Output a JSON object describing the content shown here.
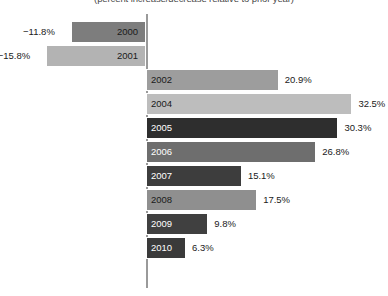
{
  "chart_data": {
    "type": "bar",
    "title": "(percent increase/decrease relative to prior year)",
    "orientation": "horizontal",
    "xlabel": "",
    "ylabel": "",
    "grid": false,
    "legend": "none",
    "zero_axis": true,
    "xlim": [
      -18,
      35
    ],
    "categories": [
      "2000",
      "2001",
      "2002",
      "2004",
      "2005",
      "2006",
      "2007",
      "2008",
      "2009",
      "2010"
    ],
    "values": [
      -11.8,
      -15.8,
      20.9,
      32.5,
      30.3,
      26.8,
      15.1,
      17.5,
      9.8,
      6.3
    ],
    "value_labels": [
      "−11.8%",
      "−15.8%",
      "20.9%",
      "32.5%",
      "30.3%",
      "26.8%",
      "15.1%",
      "17.5%",
      "9.8%",
      "6.3%"
    ],
    "bars": [
      {
        "year": "2000",
        "value": -11.8,
        "label": "−11.8%",
        "color": "#7d7d7d",
        "year_text_color": "#1a1a1a"
      },
      {
        "year": "2001",
        "value": -15.8,
        "label": "−15.8%",
        "color": "#b3b3b3",
        "year_text_color": "#1a1a1a"
      },
      {
        "year": "2002",
        "value": 20.9,
        "label": "20.9%",
        "color": "#9d9d9d",
        "year_text_color": "#1a1a1a"
      },
      {
        "year": "2004",
        "value": 32.5,
        "label": "32.5%",
        "color": "#bdbdbd",
        "year_text_color": "#1a1a1a"
      },
      {
        "year": "2005",
        "value": 30.3,
        "label": "30.3%",
        "color": "#2e2e2e",
        "year_text_color": "#ffffff"
      },
      {
        "year": "2006",
        "value": 26.8,
        "label": "26.8%",
        "color": "#6e6e6e",
        "year_text_color": "#ffffff"
      },
      {
        "year": "2007",
        "value": 15.1,
        "label": "15.1%",
        "color": "#3d3d3d",
        "year_text_color": "#ffffff"
      },
      {
        "year": "2008",
        "value": 17.5,
        "label": "17.5%",
        "color": "#8f8f8f",
        "year_text_color": "#1a1a1a"
      },
      {
        "year": "2009",
        "value": 9.8,
        "label": "9.8%",
        "color": "#404040",
        "year_text_color": "#ffffff"
      },
      {
        "year": "2010",
        "value": 6.3,
        "label": "6.3%",
        "color": "#3a3a3a",
        "year_text_color": "#ffffff"
      }
    ],
    "colors": {
      "axis": "#9a9a9a",
      "background": "#ffffff",
      "title": "#4a4a4a",
      "value_label": "#1a1a1a"
    },
    "layout": {
      "zero_x": 146,
      "px_per_percent": 6.35,
      "first_row_top": 21,
      "row_pitch": 24,
      "bar_height": 22,
      "axis_top": 14,
      "axis_bottom": 288
    }
  }
}
